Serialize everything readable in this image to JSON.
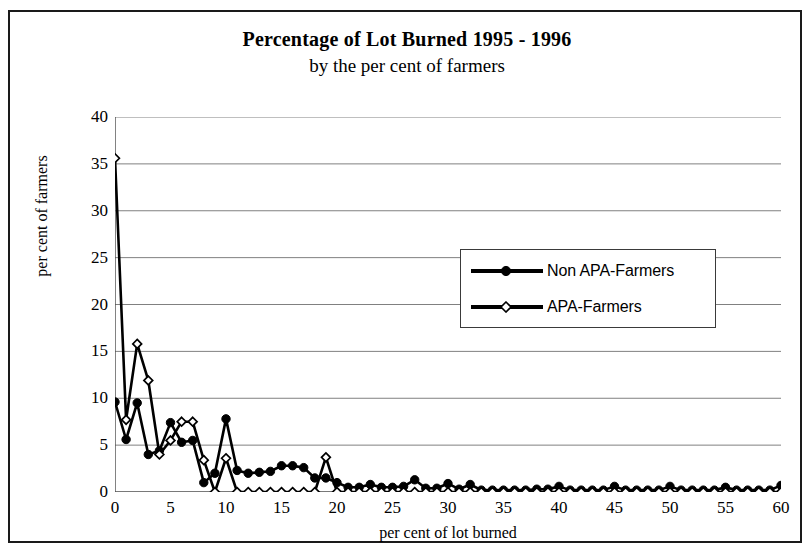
{
  "chart_data": {
    "type": "line",
    "title": "Percentage of Lot Burned 1995 - 1996",
    "subtitle": "by the per cent of farmers",
    "xlabel": "per cent of lot burned",
    "ylabel": "per cent of farmers",
    "xlim": [
      0,
      60
    ],
    "ylim": [
      0,
      40
    ],
    "xticks": [
      0,
      5,
      10,
      15,
      20,
      25,
      30,
      35,
      40,
      45,
      50,
      55,
      60
    ],
    "yticks": [
      0,
      5,
      10,
      15,
      20,
      25,
      30,
      35,
      40
    ],
    "grid": "horizontal",
    "legend_position": "center-right",
    "x": [
      0,
      1,
      2,
      3,
      4,
      5,
      6,
      7,
      8,
      9,
      10,
      11,
      12,
      13,
      14,
      15,
      16,
      17,
      18,
      19,
      20,
      21,
      22,
      23,
      24,
      25,
      26,
      27,
      28,
      29,
      30,
      31,
      32,
      33,
      34,
      35,
      36,
      37,
      38,
      39,
      40,
      41,
      42,
      43,
      44,
      45,
      46,
      47,
      48,
      49,
      50,
      51,
      52,
      53,
      54,
      55,
      56,
      57,
      58,
      59,
      60
    ],
    "series": [
      {
        "name": "Non APA-Farmers",
        "marker": "filled-circle",
        "values": [
          9.6,
          5.6,
          9.5,
          4.0,
          4.4,
          7.4,
          5.3,
          5.5,
          1.0,
          2.0,
          7.8,
          2.3,
          2.0,
          2.1,
          2.2,
          2.8,
          2.8,
          2.6,
          1.5,
          1.5,
          1.0,
          0.5,
          0.5,
          0.8,
          0.5,
          0.5,
          0.6,
          1.3,
          0.4,
          0.4,
          0.9,
          0.3,
          0.8,
          0.2,
          0.2,
          0.2,
          0.2,
          0.2,
          0.3,
          0.3,
          0.6,
          0.2,
          0.2,
          0.2,
          0.2,
          0.6,
          0.2,
          0.2,
          0.2,
          0.2,
          0.6,
          0.2,
          0.2,
          0.2,
          0.2,
          0.5,
          0.2,
          0.2,
          0.2,
          0.2,
          0.7
        ]
      },
      {
        "name": "APA-Farmers",
        "marker": "open-diamond",
        "values": [
          35.6,
          7.7,
          15.8,
          11.9,
          4.0,
          5.5,
          7.5,
          7.5,
          3.4,
          0.0,
          3.6,
          0.0,
          0.0,
          0.0,
          0.0,
          0.0,
          0.0,
          0.0,
          0.0,
          3.7,
          0.0,
          0.0,
          0.0,
          0.0,
          0.0,
          0.0,
          0.0,
          0.0,
          0.0,
          0.0,
          0.0,
          0.0,
          0.0,
          0.0,
          0.0,
          0.0,
          0.0,
          0.0,
          0.0,
          0.0,
          0.0,
          0.0,
          0.0,
          0.0,
          0.0,
          0.0,
          0.0,
          0.0,
          0.0,
          0.0,
          0.0,
          0.0,
          0.0,
          0.0,
          0.0,
          0.0,
          0.0,
          0.0,
          0.0,
          0.0,
          0.0
        ]
      }
    ],
    "colors": {
      "line": "#000000",
      "grid": "#808080",
      "axis": "#4d4d4d",
      "background": "#ffffff",
      "border": "#1a1a1a"
    }
  }
}
